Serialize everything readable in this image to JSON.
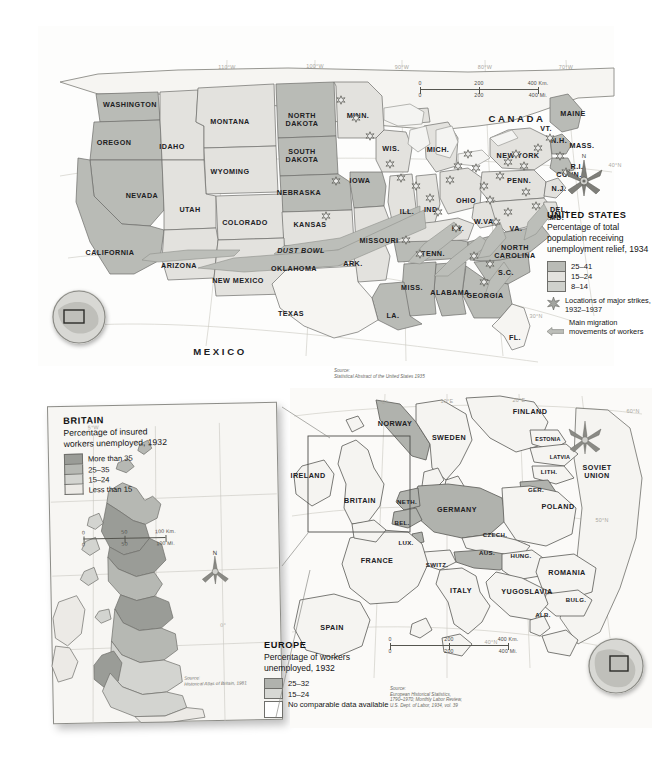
{
  "us_map": {
    "country_labels": [
      {
        "text": "CANADA",
        "x": 479,
        "y": 92,
        "cls": "lbl big"
      },
      {
        "text": "MEXICO",
        "x": 182,
        "y": 325,
        "cls": "lbl big"
      }
    ],
    "state_labels": [
      {
        "text": "WASHINGTON",
        "x": 92,
        "y": 79
      },
      {
        "text": "OREGON",
        "x": 76,
        "y": 117
      },
      {
        "text": "IDAHO",
        "x": 134,
        "y": 121
      },
      {
        "text": "MONTANA",
        "x": 192,
        "y": 96
      },
      {
        "text": "NORTH\nDAKOTA",
        "x": 264,
        "y": 94
      },
      {
        "text": "MINN.",
        "x": 320,
        "y": 90
      },
      {
        "text": "SOUTH\nDAKOTA",
        "x": 264,
        "y": 130
      },
      {
        "text": "WIS.",
        "x": 353,
        "y": 123
      },
      {
        "text": "MICH.",
        "x": 400,
        "y": 124
      },
      {
        "text": "WYOMING",
        "x": 192,
        "y": 146
      },
      {
        "text": "NEBRASKA",
        "x": 261,
        "y": 167
      },
      {
        "text": "IOWA",
        "x": 322,
        "y": 155
      },
      {
        "text": "NEVADA",
        "x": 104,
        "y": 170
      },
      {
        "text": "UTAH",
        "x": 152,
        "y": 184
      },
      {
        "text": "COLORADO",
        "x": 207,
        "y": 197
      },
      {
        "text": "KANSAS",
        "x": 272,
        "y": 199
      },
      {
        "text": "ILL.",
        "x": 369,
        "y": 186
      },
      {
        "text": "IND.",
        "x": 394,
        "y": 184
      },
      {
        "text": "OHIO",
        "x": 428,
        "y": 175
      },
      {
        "text": "NEW YORK",
        "x": 480,
        "y": 130
      },
      {
        "text": "PENN.",
        "x": 481,
        "y": 155
      },
      {
        "text": "CALIFORNIA",
        "x": 72,
        "y": 227
      },
      {
        "text": "ARIZONA",
        "x": 141,
        "y": 240
      },
      {
        "text": "NEW MEXICO",
        "x": 200,
        "y": 255
      },
      {
        "text": "OKLAHOMA",
        "x": 256,
        "y": 243
      },
      {
        "text": "ARK.",
        "x": 315,
        "y": 238
      },
      {
        "text": "MISSOURI",
        "x": 341,
        "y": 215
      },
      {
        "text": "TENN.",
        "x": 395,
        "y": 228
      },
      {
        "text": "KY.",
        "x": 420,
        "y": 203
      },
      {
        "text": "W.VA.",
        "x": 447,
        "y": 196
      },
      {
        "text": "VA.",
        "x": 478,
        "y": 203
      },
      {
        "text": "NORTH\nCAROLINA",
        "x": 477,
        "y": 226
      },
      {
        "text": "S.C.",
        "x": 468,
        "y": 247
      },
      {
        "text": "GEORGIA",
        "x": 447,
        "y": 270
      },
      {
        "text": "ALABAMA",
        "x": 412,
        "y": 267
      },
      {
        "text": "MISS.",
        "x": 374,
        "y": 262
      },
      {
        "text": "LA.",
        "x": 355,
        "y": 290
      },
      {
        "text": "TEXAS",
        "x": 253,
        "y": 288
      },
      {
        "text": "FL.",
        "x": 477,
        "y": 312
      },
      {
        "text": "MAINE",
        "x": 535,
        "y": 88
      },
      {
        "text": "VT.",
        "x": 508,
        "y": 103
      },
      {
        "text": "N.H.",
        "x": 521,
        "y": 115
      },
      {
        "text": "MASS.",
        "x": 544,
        "y": 120
      },
      {
        "text": "R.I.",
        "x": 539,
        "y": 141
      },
      {
        "text": "CONN.",
        "x": 531,
        "y": 149
      },
      {
        "text": "N.J.",
        "x": 521,
        "y": 163
      },
      {
        "text": "DEL.",
        "x": 521,
        "y": 184
      },
      {
        "text": "MD.",
        "x": 519,
        "y": 192
      }
    ],
    "region_label": {
      "text": "DUST BOWL",
      "x": 263,
      "y": 224
    },
    "graticule_labels": [
      {
        "text": "110°W",
        "x": 189,
        "y": 41
      },
      {
        "text": "100°W",
        "x": 277,
        "y": 40
      },
      {
        "text": "90°W",
        "x": 364,
        "y": 41
      },
      {
        "text": "80°W",
        "x": 447,
        "y": 41
      },
      {
        "text": "70°W",
        "x": 528,
        "y": 41
      },
      {
        "text": "40°N",
        "x": 577,
        "y": 139
      },
      {
        "text": "30°N",
        "x": 498,
        "y": 290
      }
    ],
    "scale": {
      "km_ticks": [
        "0",
        "200",
        "400 Km."
      ],
      "mi_ticks": [
        "0",
        "200",
        "400 Mi."
      ]
    },
    "source": "Source:\nStatistical Abstract of the United States 1935",
    "source_lines": [
      "Source:",
      "Statistical Abstract of the United States 1935"
    ],
    "legend": {
      "title": "UNITED STATES",
      "subtitle": "Percentage of total population receiving unemployment relief, 1934",
      "classes": [
        {
          "label": "25–41",
          "color": "#b9bbb6"
        },
        {
          "label": "15–24",
          "color": "#e3e2de"
        },
        {
          "label": "8–14",
          "color": "#cfd1cc"
        }
      ],
      "symbols": [
        {
          "icon": "star-icon",
          "label": "Locations of major strikes, 1932–1937"
        },
        {
          "icon": "arrow-left-icon",
          "label": "Main migration movements of workers"
        }
      ]
    }
  },
  "britain_map": {
    "legend": {
      "title": "BRITAIN",
      "subtitle": "Percentage of insured workers unemployed, 1932",
      "classes": [
        {
          "label": "More than 35",
          "color": "#9a9c97"
        },
        {
          "label": "25–35",
          "color": "#b6b8b3"
        },
        {
          "label": "15–24",
          "color": "#d3d4d0"
        },
        {
          "label": "Less than 15",
          "color": "#eceae6"
        }
      ]
    },
    "scale": {
      "km_ticks": [
        "0",
        "50",
        "100 Km."
      ],
      "mi_ticks": [
        "0",
        "50",
        "100 Mi."
      ]
    },
    "graticule_labels": [
      {
        "text": "5°W",
        "x": 46,
        "y": 22
      },
      {
        "text": "0°",
        "x": 172,
        "y": 222
      }
    ],
    "compass_label": "N",
    "source_lines": [
      "Source:",
      "Historical Atlas of Britain, 1981"
    ]
  },
  "europe_map": {
    "country_labels": [
      {
        "text": "NORWAY",
        "x": 105,
        "y": 36
      },
      {
        "text": "SWEDEN",
        "x": 159,
        "y": 50
      },
      {
        "text": "FINLAND",
        "x": 240,
        "y": 24
      },
      {
        "text": "ESTONIA",
        "x": 258,
        "y": 51,
        "cls": "lbl xs"
      },
      {
        "text": "LATVIA",
        "x": 270,
        "y": 69,
        "cls": "lbl xs"
      },
      {
        "text": "LITH.",
        "x": 259,
        "y": 84,
        "cls": "lbl sm"
      },
      {
        "text": "SOVIET\nUNION",
        "x": 307,
        "y": 84
      },
      {
        "text": "GER.",
        "x": 246,
        "y": 102,
        "cls": "lbl sm"
      },
      {
        "text": "POLAND",
        "x": 268,
        "y": 119
      },
      {
        "text": "IRELAND",
        "x": 18,
        "y": 88
      },
      {
        "text": "BRITAIN",
        "x": 70,
        "y": 113
      },
      {
        "text": "NETH.",
        "x": 117,
        "y": 114,
        "cls": "lbl sm"
      },
      {
        "text": "BEL.",
        "x": 112,
        "y": 135,
        "cls": "lbl sm"
      },
      {
        "text": "LUX.",
        "x": 116,
        "y": 155,
        "cls": "lbl sm"
      },
      {
        "text": "GERMANY",
        "x": 167,
        "y": 122
      },
      {
        "text": "CZECH.",
        "x": 205,
        "y": 147,
        "cls": "lbl sm"
      },
      {
        "text": "FRANCE",
        "x": 87,
        "y": 173
      },
      {
        "text": "SWITZ.",
        "x": 147,
        "y": 177,
        "cls": "lbl sm"
      },
      {
        "text": "AUS.",
        "x": 197,
        "y": 165,
        "cls": "lbl sm"
      },
      {
        "text": "HUNG.",
        "x": 231,
        "y": 168,
        "cls": "lbl sm"
      },
      {
        "text": "ROMANIA",
        "x": 277,
        "y": 185
      },
      {
        "text": "YUGOSLAVIA",
        "x": 237,
        "y": 204
      },
      {
        "text": "BULG.",
        "x": 286,
        "y": 212,
        "cls": "lbl sm"
      },
      {
        "text": "ITALY",
        "x": 171,
        "y": 203
      },
      {
        "text": "ALB.",
        "x": 253,
        "y": 227,
        "cls": "lbl sm"
      },
      {
        "text": "SPAIN",
        "x": 42,
        "y": 240
      }
    ],
    "graticule_labels": [
      {
        "text": "0°",
        "x": 95,
        "y": 14
      },
      {
        "text": "10°E",
        "x": 157,
        "y": 13
      },
      {
        "text": "20°E",
        "x": 229,
        "y": 12
      },
      {
        "text": "60°N",
        "x": 343,
        "y": 23
      },
      {
        "text": "50°N",
        "x": 312,
        "y": 132
      },
      {
        "text": "40°N",
        "x": 201,
        "y": 254
      }
    ],
    "compass_label": "N",
    "legend": {
      "title": "EUROPE",
      "subtitle": "Percentage of workers unemployed, 1932",
      "classes": [
        {
          "label": "25–32",
          "color": "#b0b2ad"
        },
        {
          "label": "15–24",
          "color": "#d7d8d4"
        },
        {
          "label": "No comparable data available",
          "color": "#ffffff"
        }
      ]
    },
    "scale": {
      "km_ticks": [
        "0",
        "200",
        "400 Km."
      ],
      "mi_ticks": [
        "0",
        "200",
        "400 Mi."
      ]
    },
    "source_lines": [
      "Source:",
      "European Historical Statistics,",
      "1790–1970; Monthly Labor Review,",
      "U.S. Dept. of Labor, 1934, vol. 39"
    ]
  }
}
